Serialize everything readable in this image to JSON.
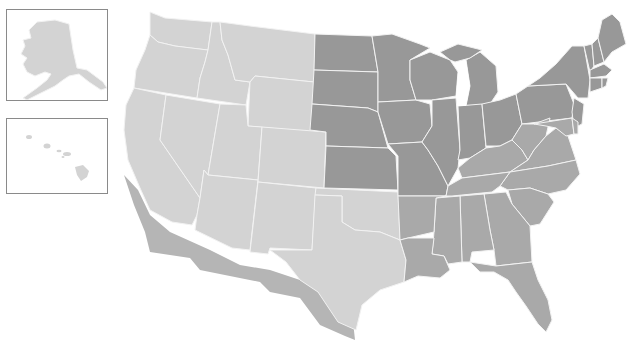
{
  "map": {
    "title": "United States choropleth map",
    "legend_tiers": {
      "light": "#d3d3d3",
      "medium": "#a9a9a9",
      "dark": "#989898"
    },
    "shadow_color": "#b5b5b5",
    "border_color": "#f2f2f2",
    "insets": [
      {
        "name": "Alaska",
        "tier": "light"
      },
      {
        "name": "Hawaii",
        "tier": "light"
      }
    ],
    "states": [
      {
        "abbr": "WA",
        "tier": "light"
      },
      {
        "abbr": "OR",
        "tier": "light"
      },
      {
        "abbr": "CA",
        "tier": "light"
      },
      {
        "abbr": "ID",
        "tier": "light"
      },
      {
        "abbr": "NV",
        "tier": "light"
      },
      {
        "abbr": "MT",
        "tier": "light"
      },
      {
        "abbr": "WY",
        "tier": "light"
      },
      {
        "abbr": "UT",
        "tier": "light"
      },
      {
        "abbr": "AZ",
        "tier": "light"
      },
      {
        "abbr": "CO",
        "tier": "light"
      },
      {
        "abbr": "NM",
        "tier": "light"
      },
      {
        "abbr": "TX",
        "tier": "light"
      },
      {
        "abbr": "OK",
        "tier": "light"
      },
      {
        "abbr": "ND",
        "tier": "dark"
      },
      {
        "abbr": "SD",
        "tier": "dark"
      },
      {
        "abbr": "NE",
        "tier": "dark"
      },
      {
        "abbr": "KS",
        "tier": "dark"
      },
      {
        "abbr": "MN",
        "tier": "dark"
      },
      {
        "abbr": "IA",
        "tier": "dark"
      },
      {
        "abbr": "MO",
        "tier": "dark"
      },
      {
        "abbr": "WI",
        "tier": "dark"
      },
      {
        "abbr": "IL",
        "tier": "dark"
      },
      {
        "abbr": "MI",
        "tier": "dark"
      },
      {
        "abbr": "IN",
        "tier": "dark"
      },
      {
        "abbr": "OH",
        "tier": "dark"
      },
      {
        "abbr": "PA",
        "tier": "dark"
      },
      {
        "abbr": "NY",
        "tier": "dark"
      },
      {
        "abbr": "NJ",
        "tier": "dark"
      },
      {
        "abbr": "VT",
        "tier": "dark"
      },
      {
        "abbr": "NH",
        "tier": "dark"
      },
      {
        "abbr": "ME",
        "tier": "dark"
      },
      {
        "abbr": "MA",
        "tier": "dark"
      },
      {
        "abbr": "CT",
        "tier": "dark"
      },
      {
        "abbr": "RI",
        "tier": "dark"
      },
      {
        "abbr": "AR",
        "tier": "medium"
      },
      {
        "abbr": "LA",
        "tier": "medium"
      },
      {
        "abbr": "MS",
        "tier": "medium"
      },
      {
        "abbr": "AL",
        "tier": "medium"
      },
      {
        "abbr": "GA",
        "tier": "medium"
      },
      {
        "abbr": "FL",
        "tier": "medium"
      },
      {
        "abbr": "SC",
        "tier": "medium"
      },
      {
        "abbr": "NC",
        "tier": "medium"
      },
      {
        "abbr": "TN",
        "tier": "medium"
      },
      {
        "abbr": "KY",
        "tier": "medium"
      },
      {
        "abbr": "VA",
        "tier": "medium"
      },
      {
        "abbr": "WV",
        "tier": "medium"
      },
      {
        "abbr": "MD",
        "tier": "medium"
      },
      {
        "abbr": "DE",
        "tier": "medium"
      }
    ]
  }
}
